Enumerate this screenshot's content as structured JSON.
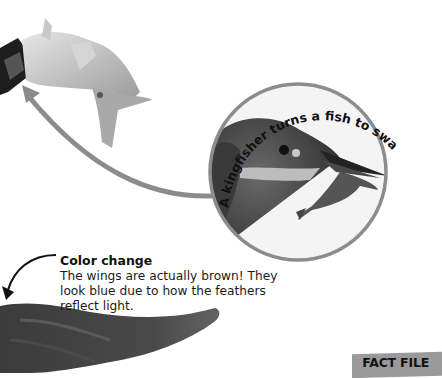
{
  "circle_caption": {
    "curved_text": "A kingfisher turns a fish to swallow it headfirst."
  },
  "callout": {
    "title": "Color change",
    "body": "The wings are actually brown! They look blue due to how the feathers reflect light."
  },
  "tab": {
    "label": "FACT FILE"
  },
  "colors": {
    "background": "#ffffff",
    "arrow_gray": "#8c8c8c",
    "circle_border": "#8c8c8c",
    "tab_gray": "#9a9a9a",
    "text": "#111111"
  },
  "images": [
    {
      "name": "fish-tail-in-beak",
      "description": "Close-up of a fish tail held in a kingfisher's beak"
    },
    {
      "name": "kingfisher-head-with-fish",
      "description": "Kingfisher head holding a small fish, inside circular inset"
    },
    {
      "name": "kingfisher-wing",
      "description": "Dark blurred wing feathers"
    }
  ]
}
